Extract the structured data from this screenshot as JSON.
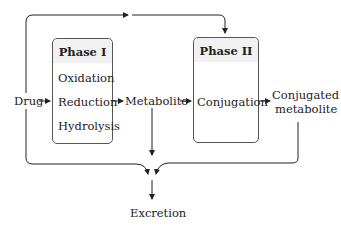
{
  "diagram": {
    "type": "flowchart",
    "nodes": {
      "drug": "Drug",
      "metabolite": "Metabolite",
      "conjugated_metabolite_line1": "Conjugated",
      "conjugated_metabolite_line2": "metabolite",
      "excretion": "Excretion"
    },
    "phase1": {
      "title": "Phase I",
      "items": [
        "Oxidation",
        "Reduction",
        "Hydrolysis"
      ]
    },
    "phase2": {
      "title": "Phase II",
      "items": [
        "Conjugation"
      ]
    },
    "edges": [
      {
        "from": "Drug",
        "to": "Phase I"
      },
      {
        "from": "Phase I",
        "to": "Metabolite"
      },
      {
        "from": "Metabolite",
        "to": "Phase II"
      },
      {
        "from": "Phase II",
        "to": "Conjugated metabolite"
      },
      {
        "from": "Drug",
        "to": "Phase II"
      },
      {
        "from": "Drug",
        "to": "Excretion"
      },
      {
        "from": "Metabolite",
        "to": "Excretion"
      },
      {
        "from": "Conjugated metabolite",
        "to": "Excretion"
      }
    ]
  }
}
